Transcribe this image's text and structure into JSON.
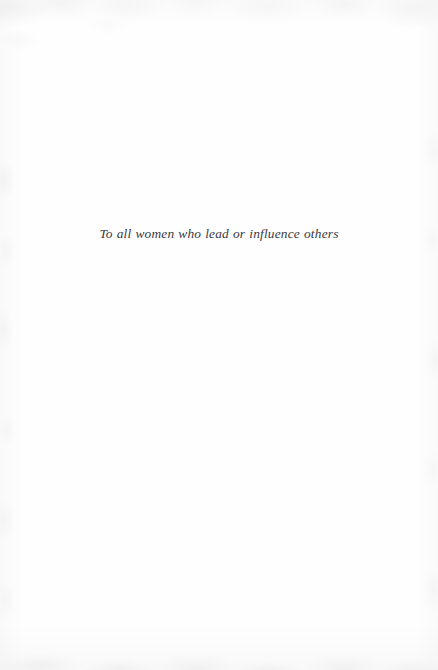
{
  "page": {
    "kind": "book-dedication-page",
    "background_color": "#fefefe",
    "paper_tint_color": "#f6f6f7",
    "width": 438,
    "height": 670
  },
  "dedication": {
    "text": "To all women who lead or influence others",
    "text_color": "#2b2b30",
    "alignment": "center",
    "style": "italic"
  }
}
